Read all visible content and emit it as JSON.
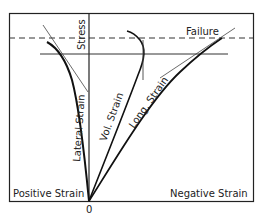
{
  "diagram": {
    "type": "stress-strain curves",
    "labels": {
      "y_axis": "Stress",
      "failure": "Failure",
      "lateral": "Lateral Strain",
      "volumetric": "Vol. Strain",
      "longitudinal": "Long. Strain",
      "positive": "Positive Strain",
      "negative": "Negative Strain",
      "origin": "0"
    },
    "colors": {
      "ink": "#222222",
      "background": "#ffffff"
    }
  }
}
